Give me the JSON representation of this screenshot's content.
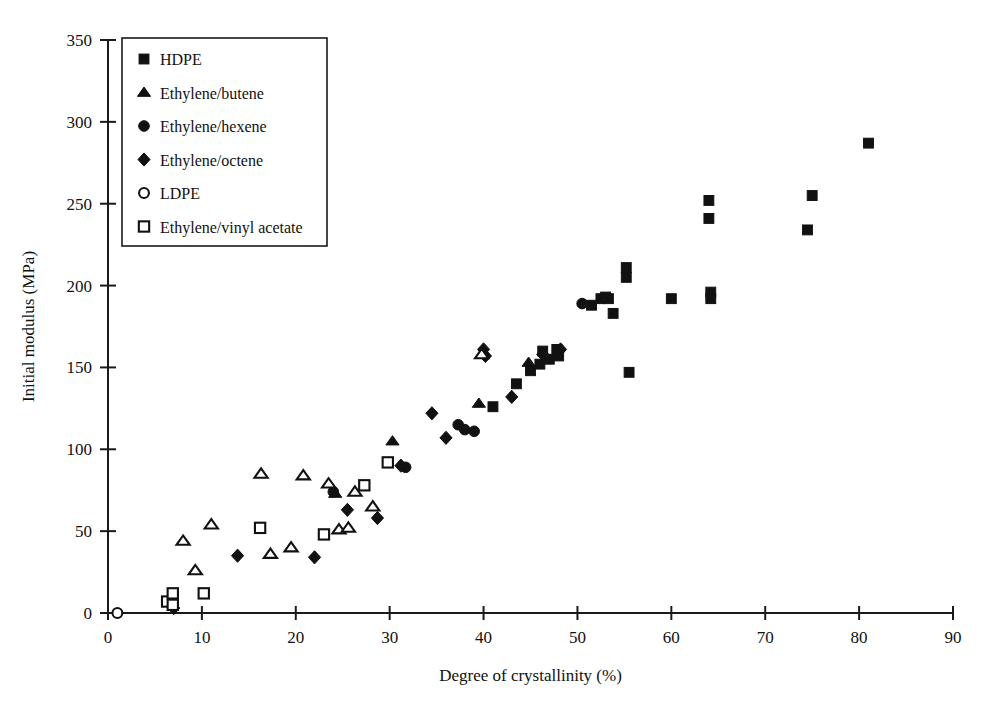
{
  "chart_data": {
    "type": "scatter",
    "title": "",
    "xlabel": "Degree of crystallinity (%)",
    "ylabel": "Initial modulus (MPa)",
    "xlim": [
      0,
      90
    ],
    "ylim": [
      0,
      350
    ],
    "xticks": [
      0,
      10,
      20,
      30,
      40,
      50,
      60,
      70,
      80,
      90
    ],
    "yticks": [
      0,
      50,
      100,
      150,
      200,
      250,
      300,
      350
    ],
    "grid": false,
    "legend_position": "upper-left-inside",
    "marker_color": "#111111",
    "series": [
      {
        "name": "HDPE",
        "marker": "filled-square",
        "points": [
          [
            41.0,
            126.0
          ],
          [
            43.5,
            140.0
          ],
          [
            45.0,
            148.0
          ],
          [
            46.3,
            160.0
          ],
          [
            46.0,
            152.0
          ],
          [
            47.0,
            155.0
          ],
          [
            47.8,
            161.0
          ],
          [
            48.0,
            157.0
          ],
          [
            51.5,
            188.0
          ],
          [
            52.5,
            192.0
          ],
          [
            53.0,
            193.0
          ],
          [
            53.3,
            192.0
          ],
          [
            53.8,
            183.0
          ],
          [
            55.2,
            211.0
          ],
          [
            55.2,
            205.0
          ],
          [
            55.5,
            147.0
          ],
          [
            60.0,
            192.0
          ],
          [
            64.0,
            252.0
          ],
          [
            64.0,
            241.0
          ],
          [
            64.2,
            196.0
          ],
          [
            64.2,
            192.0
          ],
          [
            74.5,
            234.0
          ],
          [
            75.0,
            255.0
          ],
          [
            81.0,
            287.0
          ]
        ]
      },
      {
        "name": "Ethylene/butene",
        "marker": "filled-triangle",
        "points": [
          [
            24.2,
            73.0
          ],
          [
            30.3,
            105.0
          ],
          [
            39.5,
            128.0
          ],
          [
            44.8,
            153.0
          ]
        ]
      },
      {
        "name": "Ethylene/hexene",
        "marker": "filled-circle",
        "points": [
          [
            24.0,
            74.0
          ],
          [
            31.7,
            89.0
          ],
          [
            37.3,
            115.0
          ],
          [
            38.0,
            112.0
          ],
          [
            39.0,
            111.0
          ],
          [
            50.5,
            189.0
          ]
        ]
      },
      {
        "name": "Ethylene/octene",
        "marker": "filled-diamond",
        "points": [
          [
            7.0,
            3.0
          ],
          [
            13.8,
            35.0
          ],
          [
            22.0,
            34.0
          ],
          [
            25.5,
            63.0
          ],
          [
            28.7,
            58.0
          ],
          [
            31.2,
            90.0
          ],
          [
            34.5,
            122.0
          ],
          [
            36.0,
            107.0
          ],
          [
            40.0,
            161.0
          ],
          [
            40.2,
            157.0
          ],
          [
            43.0,
            132.0
          ],
          [
            46.3,
            158.0
          ],
          [
            48.2,
            161.0
          ]
        ]
      },
      {
        "name": "LDPE",
        "marker": "open-circle",
        "points": [
          [
            1.0,
            0.0
          ]
        ]
      },
      {
        "name": "Ethylene/vinyl acetate",
        "marker": "open-square",
        "points": [
          [
            6.3,
            7.0
          ],
          [
            6.9,
            12.0
          ],
          [
            6.9,
            5.0
          ],
          [
            10.2,
            12.0
          ],
          [
            16.2,
            52.0
          ],
          [
            23.0,
            48.0
          ],
          [
            27.3,
            78.0
          ],
          [
            29.8,
            92.0
          ]
        ]
      },
      {
        "name": "Ethylene/butene-open",
        "marker": "open-triangle",
        "points": [
          [
            8.0,
            44.0
          ],
          [
            9.3,
            26.0
          ],
          [
            11.0,
            54.0
          ],
          [
            16.3,
            85.0
          ],
          [
            17.3,
            36.0
          ],
          [
            19.5,
            40.0
          ],
          [
            20.8,
            84.0
          ],
          [
            23.5,
            79.0
          ],
          [
            24.6,
            51.0
          ],
          [
            25.6,
            52.0
          ],
          [
            26.3,
            74.0
          ],
          [
            28.2,
            65.0
          ],
          [
            39.8,
            158.0
          ]
        ]
      }
    ]
  },
  "axes": {
    "x_ticks": [
      "0",
      "10",
      "20",
      "30",
      "40",
      "50",
      "60",
      "70",
      "80",
      "90"
    ],
    "y_ticks": [
      "0",
      "50",
      "100",
      "150",
      "200",
      "250",
      "300",
      "350"
    ],
    "x_title": "Degree of crystallinity (%)",
    "y_title": "Initial modulus (MPa)"
  },
  "legend": {
    "entries": [
      {
        "label": "HDPE",
        "marker": "filled-square"
      },
      {
        "label": "Ethylene/butene",
        "marker": "filled-triangle"
      },
      {
        "label": "Ethylene/hexene",
        "marker": "filled-circle"
      },
      {
        "label": "Ethylene/octene",
        "marker": "filled-diamond"
      },
      {
        "label": "LDPE",
        "marker": "open-circle"
      },
      {
        "label": "Ethylene/vinyl acetate",
        "marker": "open-square"
      }
    ]
  }
}
